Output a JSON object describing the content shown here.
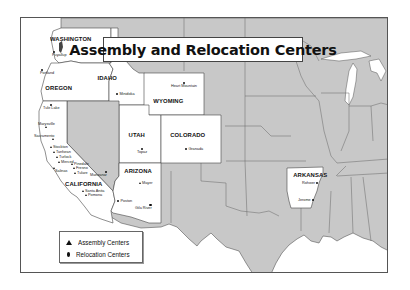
{
  "title": "Assembly and Relocation Centers",
  "colors": {
    "highlighted_state_fill": "#ffffff",
    "other_state_fill": "#c8c8c8",
    "border": "#555555",
    "water": "#ffffff"
  },
  "states": [
    {
      "id": "washington",
      "label": "WASHINGTON",
      "highlighted": true
    },
    {
      "id": "oregon",
      "label": "OREGON",
      "highlighted": true
    },
    {
      "id": "idaho",
      "label": "IDAHO",
      "highlighted": true
    },
    {
      "id": "wyoming",
      "label": "WYOMING",
      "highlighted": true
    },
    {
      "id": "utah",
      "label": "UTAH",
      "highlighted": true
    },
    {
      "id": "colorado",
      "label": "COLORADO",
      "highlighted": true
    },
    {
      "id": "california",
      "label": "CALIFORNIA",
      "highlighted": true
    },
    {
      "id": "arizona",
      "label": "ARIZONA",
      "highlighted": true
    },
    {
      "id": "arkansas",
      "label": "ARKANSAS",
      "highlighted": true
    }
  ],
  "sites": [
    {
      "name": "Puyallup",
      "type": "assembly",
      "state": "Washington"
    },
    {
      "name": "Portland",
      "type": "assembly",
      "state": "Oregon"
    },
    {
      "name": "Minidoka",
      "type": "relocation",
      "state": "Idaho"
    },
    {
      "name": "Heart Mountain",
      "type": "relocation",
      "state": "Wyoming"
    },
    {
      "name": "Tule Lake",
      "type": "relocation",
      "state": "California"
    },
    {
      "name": "Marysville",
      "type": "assembly",
      "state": "California"
    },
    {
      "name": "Sacramento",
      "type": "assembly",
      "state": "California"
    },
    {
      "name": "Stockton",
      "type": "assembly",
      "state": "California"
    },
    {
      "name": "Tanforan",
      "type": "assembly",
      "state": "California"
    },
    {
      "name": "Turlock",
      "type": "assembly",
      "state": "California"
    },
    {
      "name": "Merced",
      "type": "assembly",
      "state": "California"
    },
    {
      "name": "Salinas",
      "type": "assembly",
      "state": "California"
    },
    {
      "name": "Pinedale",
      "type": "assembly",
      "state": "California"
    },
    {
      "name": "Fresno",
      "type": "assembly",
      "state": "California"
    },
    {
      "name": "Tulare",
      "type": "assembly",
      "state": "California"
    },
    {
      "name": "Manzanar",
      "type": "relocation",
      "state": "California"
    },
    {
      "name": "Santa Anita",
      "type": "assembly",
      "state": "California"
    },
    {
      "name": "Pomona",
      "type": "assembly",
      "state": "California"
    },
    {
      "name": "Topaz",
      "type": "relocation",
      "state": "Utah"
    },
    {
      "name": "Granada",
      "type": "relocation",
      "state": "Colorado"
    },
    {
      "name": "Mayer",
      "type": "assembly",
      "state": "Arizona"
    },
    {
      "name": "Poston",
      "type": "relocation",
      "state": "Arizona"
    },
    {
      "name": "Gila River",
      "type": "relocation",
      "state": "Arizona"
    },
    {
      "name": "Rohwer",
      "type": "relocation",
      "state": "Arkansas"
    },
    {
      "name": "Jerome",
      "type": "relocation",
      "state": "Arkansas"
    }
  ],
  "legend": {
    "assembly_label": "Assembly Centers",
    "relocation_label": "Relocation Centers"
  }
}
